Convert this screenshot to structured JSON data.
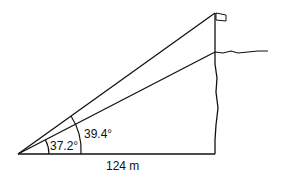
{
  "diagram": {
    "type": "trigonometry-figure",
    "labels": {
      "inner_angle": "37.2°",
      "outer_angle": "39.4°",
      "base_distance": "124 m"
    },
    "colors": {
      "stroke": "#111111",
      "background": "#ffffff"
    }
  }
}
